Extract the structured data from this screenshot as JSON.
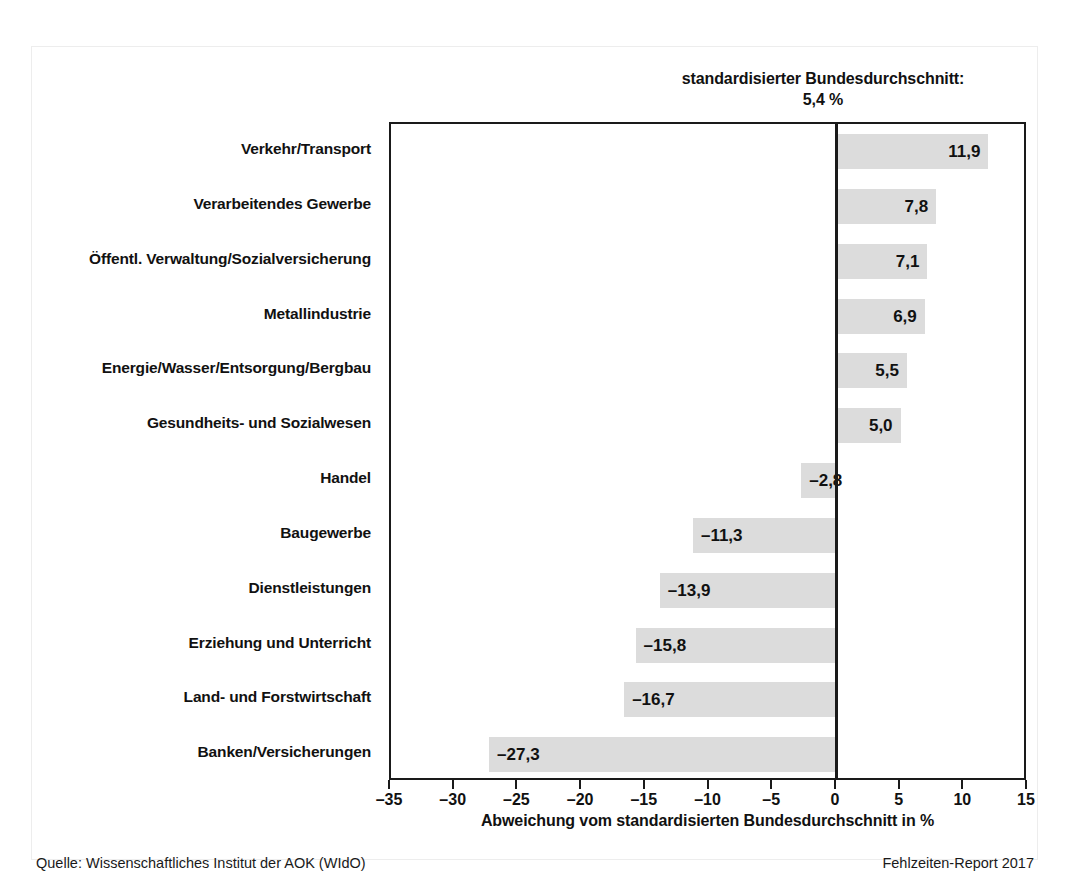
{
  "header": {
    "average_label": "standardisierter Bundesdurchschnitt:",
    "average_value": "5,4 %"
  },
  "footer": {
    "source": "Quelle: Wissenschaftliches Institut der AOK (WIdO)",
    "report": "Fehlzeiten-Report 2017"
  },
  "colors": {
    "bar_fill": "#dcdcdc",
    "axis": "#1a1a1a",
    "text": "#111111",
    "page_frame": "#ededed",
    "background": "#ffffff"
  },
  "chart_data": {
    "type": "bar",
    "orientation": "horizontal",
    "title": "standardisierter Bundesdurchschnitt: 5,4 %",
    "xlabel": "Abweichung vom standardisierten Bundesdurchschnitt in %",
    "ylabel": "",
    "xlim": [
      -35,
      15
    ],
    "xticks": [
      -35,
      -30,
      -25,
      -20,
      -15,
      -10,
      -5,
      0,
      5,
      10,
      15
    ],
    "xtick_labels": [
      "–35",
      "–30",
      "–25",
      "–20",
      "–15",
      "–10",
      "–5",
      "0",
      "5",
      "10",
      "15"
    ],
    "grid": false,
    "legend": null,
    "reference_line": 0,
    "reference_value": 5.4,
    "categories": [
      "Verkehr/Transport",
      "Verarbeitendes Gewerbe",
      "Öffentl. Verwaltung/Sozialversicherung",
      "Metallindustrie",
      "Energie/Wasser/Entsorgung/Bergbau",
      "Gesundheits- und Sozialwesen",
      "Handel",
      "Baugewerbe",
      "Dienstleistungen",
      "Erziehung und Unterricht",
      "Land- und Forstwirtschaft",
      "Banken/Versicherungen"
    ],
    "values": [
      11.9,
      7.8,
      7.1,
      6.9,
      5.5,
      5.0,
      -2.8,
      -11.3,
      -13.9,
      -15.8,
      -16.7,
      -27.3
    ],
    "value_labels": [
      "11,9",
      "7,8",
      "7,1",
      "6,9",
      "5,5",
      "5,0",
      "–2,8",
      "–11,3",
      "–13,9",
      "–15,8",
      "–16,7",
      "–27,3"
    ]
  }
}
